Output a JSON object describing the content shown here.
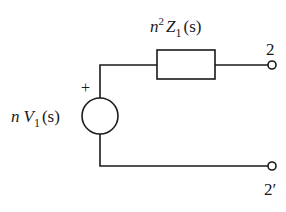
{
  "diagram": {
    "type": "circuit",
    "impedance": {
      "label_coef": "n",
      "label_exp": "2",
      "label_sym": "Z",
      "label_sub": "1",
      "label_arg": "(s)"
    },
    "source": {
      "label_coef": "n",
      "label_sym": "V",
      "label_sub": "1",
      "label_arg": "(s)",
      "polarity": "+"
    },
    "terminals": {
      "top": "2",
      "bottom": "2′"
    },
    "colors": {
      "stroke": "#1a1a1a",
      "background": "#ffffff"
    }
  }
}
